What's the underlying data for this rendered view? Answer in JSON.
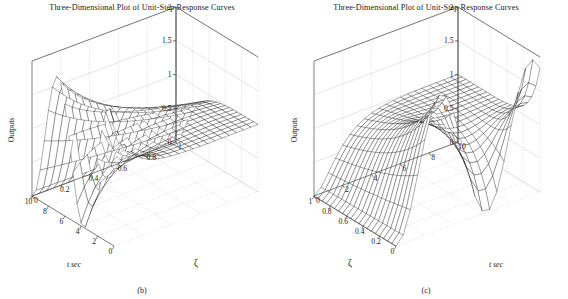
{
  "figure": {
    "panels": [
      {
        "id": "panel-b",
        "title": "Three-Dimensional Plot of Unit-Step Response Curves",
        "subcaption": "(b)",
        "zlabel": "Outputs",
        "xlabel": "t sec",
        "ylabel": "ζ",
        "view": "t-descending",
        "z_ticks": [
          "0",
          "0.5",
          "1",
          "1.5",
          "2"
        ],
        "t_ticks": [
          "10",
          "8",
          "6",
          "4",
          "2",
          "0"
        ],
        "zeta_ticks": [
          "0",
          "0.2",
          "0.4",
          "0.6",
          "0.8",
          "1"
        ]
      },
      {
        "id": "panel-c",
        "title": "Three-Dimensional Plot of Unit-Step Response Curves",
        "subcaption": "(c)",
        "zlabel": "Outputs",
        "xlabel": "t sec",
        "ylabel": "ζ",
        "view": "zeta-descending",
        "z_ticks": [
          "0",
          "0.5",
          "1",
          "1.5",
          "2"
        ],
        "t_ticks": [
          "0",
          "2",
          "4",
          "6",
          "8",
          "10"
        ],
        "zeta_ticks": [
          "1",
          "0.8",
          "0.6",
          "0.4",
          "0.2",
          "0"
        ]
      }
    ]
  },
  "chart_data": {
    "type": "surface",
    "title": "Three-Dimensional Plot of Unit-Step Response Curves",
    "function": "c(t) = 1 - exp(-z*t)/sqrt(1-z^2) * sin(sqrt(1-z^2)*t + acos(z))",
    "natural_frequency": 1,
    "xlabel": "t sec",
    "ylabel": "ζ",
    "zlabel": "Outputs",
    "xlim": [
      0,
      10
    ],
    "ylim": [
      0,
      1
    ],
    "zlim": [
      0,
      2
    ],
    "grid": true,
    "legend": "none",
    "x_ticks": [
      0,
      2,
      4,
      6,
      8,
      10
    ],
    "y_ticks": [
      0,
      0.2,
      0.4,
      0.6,
      0.8,
      1
    ],
    "z_ticks": [
      0,
      0.5,
      1,
      1.5,
      2
    ],
    "mesh_rows": 21,
    "mesh_cols": 21,
    "zeta_values": [
      0,
      0.05,
      0.1,
      0.15,
      0.2,
      0.25,
      0.3,
      0.35,
      0.4,
      0.45,
      0.5,
      0.55,
      0.6,
      0.65,
      0.7,
      0.75,
      0.8,
      0.85,
      0.9,
      0.95,
      1.0
    ],
    "t_values": [
      0,
      0.5,
      1,
      1.5,
      2,
      2.5,
      3,
      3.5,
      4,
      4.5,
      5,
      5.5,
      6,
      6.5,
      7,
      7.5,
      8,
      8.5,
      9,
      9.5,
      10
    ],
    "notes": [
      "At zeta = 0 the response is undamped and oscillates between 0 and 2.",
      "Overshoot decreases monotonically as zeta increases.",
      "For zeta >= 1 the response is critically or over-damped and rises smoothly toward 1.",
      "All curves settle toward the steady-state value of 1."
    ]
  }
}
